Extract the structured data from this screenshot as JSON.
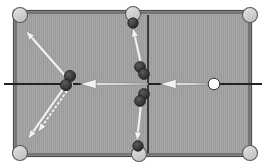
{
  "diagram": {
    "type": "pool-table-top-view",
    "canvas": {
      "width": 268,
      "height": 166
    },
    "colors": {
      "background": "#ffffff",
      "felt": "#9c9c9c",
      "felt_texture": "#a4a4a4",
      "rail": "#6d6d6d",
      "rail_outer": "#8a8a8a",
      "center_line": "#222222",
      "pocket_fill": "#d2d2d2",
      "pocket_stroke": "#5a5a5a",
      "object_ball": "#3a3a3a",
      "object_ball_stroke": "#1d1d1d",
      "cue_ball": "#ffffff",
      "cue_ball_stroke": "#333333",
      "arrow": "#f2f2f2",
      "arrow_shadow": "#6f6f6f"
    },
    "table": {
      "label": "pool-table",
      "x": 16,
      "y": 13,
      "width": 233,
      "height": 141,
      "rail_thickness": 2
    },
    "center_lines": {
      "horizontal": {
        "label": "long-axis-line",
        "x1": 4,
        "y1": 84,
        "x2": 262,
        "y2": 84
      },
      "vertical": {
        "label": "short-axis-line",
        "x1": 148,
        "y1": 15,
        "x2": 148,
        "y2": 153
      }
    },
    "pockets": [
      {
        "name": "pocket-top-left",
        "cx": 20,
        "cy": 15,
        "r": 7.5
      },
      {
        "name": "pocket-top-side",
        "cx": 133,
        "cy": 14,
        "r": 7.5
      },
      {
        "name": "pocket-top-right",
        "cx": 250,
        "cy": 15,
        "r": 7.5
      },
      {
        "name": "pocket-bottom-left",
        "cx": 20,
        "cy": 153,
        "r": 7.5
      },
      {
        "name": "pocket-bottom-side",
        "cx": 139,
        "cy": 154,
        "r": 7.5
      },
      {
        "name": "pocket-bottom-right",
        "cx": 250,
        "cy": 153,
        "r": 7.5
      }
    ],
    "object_balls": [
      {
        "name": "object-ball-top-pocket",
        "cx": 133,
        "cy": 23,
        "r": 5.2
      },
      {
        "name": "object-ball-left-upper",
        "cx": 70,
        "cy": 76,
        "r": 5.6
      },
      {
        "name": "object-ball-left-lower",
        "cx": 66,
        "cy": 85,
        "r": 5.6
      },
      {
        "name": "object-ball-center-upper-a",
        "cx": 140,
        "cy": 67,
        "r": 5.4
      },
      {
        "name": "object-ball-center-upper-b",
        "cx": 144,
        "cy": 74,
        "r": 5.4
      },
      {
        "name": "object-ball-center-lower-a",
        "cx": 144,
        "cy": 94,
        "r": 5.4
      },
      {
        "name": "object-ball-center-lower-b",
        "cx": 140,
        "cy": 101,
        "r": 5.4
      },
      {
        "name": "object-ball-bottom-pocket",
        "cx": 138,
        "cy": 146,
        "r": 5.2
      }
    ],
    "cue_ball": {
      "name": "cue-ball",
      "cx": 214,
      "cy": 84,
      "r": 5.8
    },
    "arrows": [
      {
        "name": "arrow-upper-left-diagonal",
        "style": "solid",
        "x1": 68,
        "y1": 79,
        "x2": 26,
        "y2": 31,
        "head_at": "end",
        "width": 2.1
      },
      {
        "name": "arrow-lower-left-solid",
        "style": "solid",
        "x1": 68,
        "y1": 82,
        "x2": 28,
        "y2": 139,
        "head_at": "end",
        "width": 2.1
      },
      {
        "name": "arrow-lower-left-dotted",
        "style": "dotted",
        "x1": 72,
        "y1": 84,
        "x2": 38,
        "y2": 132,
        "head_at": "end",
        "width": 2.0
      },
      {
        "name": "arrow-center-horizontal-left",
        "style": "solid-taper",
        "x1": 148,
        "y1": 84,
        "x2": 80,
        "y2": 84,
        "head_at": "end",
        "width": 4.2
      },
      {
        "name": "arrow-cue-horizontal-left",
        "style": "solid-taper",
        "x1": 210,
        "y1": 84,
        "x2": 160,
        "y2": 84,
        "head_at": "end",
        "width": 4.2
      },
      {
        "name": "arrow-top-vertical",
        "style": "solid",
        "x1": 141,
        "y1": 64,
        "x2": 133,
        "y2": 28,
        "head_at": "end",
        "width": 2.1
      },
      {
        "name": "arrow-bottom-vertical",
        "style": "solid",
        "x1": 141,
        "y1": 104,
        "x2": 137,
        "y2": 141,
        "head_at": "end",
        "width": 2.1
      }
    ]
  }
}
